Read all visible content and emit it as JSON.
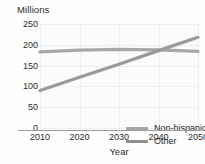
{
  "chart_data": {
    "type": "line",
    "title": "",
    "ylabel": "Millions",
    "xlabel": "Year",
    "xlim": [
      2010,
      2050
    ],
    "ylim": [
      0,
      250
    ],
    "yticks": [
      0,
      50,
      100,
      150,
      200,
      250
    ],
    "xticks": [
      2010,
      2020,
      2030,
      2040,
      2050
    ],
    "grid": true,
    "legend_position": "inside-lower-right",
    "x": [
      2010,
      2020,
      2030,
      2040,
      2050
    ],
    "series": [
      {
        "name": "Non-hispanic white",
        "color": "#a8a8a8",
        "values": [
          183,
          187,
          189,
          188,
          184
        ]
      },
      {
        "name": "Other",
        "color": "#9a9a9a",
        "values": [
          90,
          122,
          153,
          186,
          218
        ]
      }
    ],
    "annotations": {
      "crossover_year": 2042,
      "crossover_value": 190
    }
  },
  "axes": {
    "y_title": "Millions",
    "x_title": "Year",
    "y_tick_labels": [
      "250",
      "200",
      "150",
      "100",
      "50",
      "0"
    ],
    "x_tick_labels": [
      "2010",
      "2020",
      "2030",
      "2040",
      "2050"
    ]
  },
  "legend": {
    "items": [
      {
        "label": "Non-hispanic white",
        "color": "#a8a8a8"
      },
      {
        "label": "Other",
        "color": "#8f8f8f"
      }
    ]
  },
  "colors": {
    "grid": "#ededed",
    "axis": "#9a9a9a",
    "plot_background": "#fbfbfb",
    "text": "#2b2b2b"
  }
}
